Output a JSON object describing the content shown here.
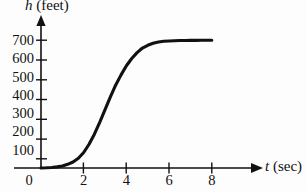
{
  "figure": {
    "background_color": "#fdfdfd",
    "ink_color": "#111111",
    "curve_color": "#111111"
  },
  "axes": {
    "y_axis_label_var": "h",
    "y_axis_label_unit": "(feet)",
    "x_axis_label_var": "t",
    "x_axis_label_unit": "(sec)",
    "origin_label": "0"
  },
  "chart_data": {
    "type": "line",
    "title": "",
    "xlabel": "t (sec)",
    "ylabel": "h (feet)",
    "xlim": [
      0,
      9.2
    ],
    "ylim": [
      0,
      760
    ],
    "grid": false,
    "legend": null,
    "x_ticks": [
      2,
      4,
      6,
      8
    ],
    "x_tick_labels": [
      "2",
      "4",
      "6",
      "8"
    ],
    "y_ticks": [
      100,
      200,
      300,
      400,
      500,
      600,
      700
    ],
    "y_tick_labels": [
      "100",
      "200",
      "300",
      "400",
      "500",
      "600",
      "700"
    ],
    "series": [
      {
        "name": "height",
        "x": [
          0,
          0.25,
          0.5,
          0.75,
          1.0,
          1.25,
          1.5,
          1.75,
          2.0,
          2.25,
          2.5,
          2.75,
          3.0,
          3.25,
          3.5,
          3.75,
          4.0,
          4.25,
          4.5,
          4.75,
          5.0,
          5.25,
          5.5,
          5.75,
          6.0,
          6.25,
          6.5,
          6.75,
          7.0,
          7.25,
          7.5,
          7.75,
          8.0
        ],
        "y": [
          0,
          1,
          3,
          6,
          11,
          20,
          33,
          53,
          85,
          130,
          185,
          250,
          320,
          390,
          455,
          510,
          560,
          600,
          632,
          657,
          672,
          683,
          690,
          694,
          696,
          697,
          698,
          698,
          699,
          699,
          700,
          700,
          700
        ]
      }
    ]
  }
}
